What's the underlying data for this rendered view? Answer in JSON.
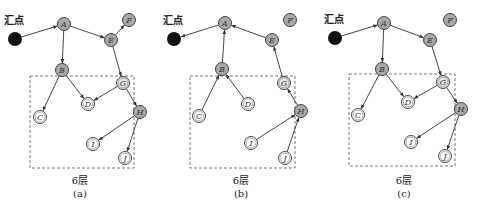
{
  "colors": {
    "sink": "#111111",
    "node_gray": "#a9a9a9",
    "node_light": "#e8e8e8",
    "node_white": "#ffffff",
    "stroke": "#333333"
  },
  "panels": [
    {
      "id": "a",
      "layer_label": "6层",
      "caption": "(a)",
      "sink": {
        "label": "汇点",
        "x": 15,
        "y": 39,
        "label_x": 4,
        "label_y": 24
      },
      "box": {
        "x": 30,
        "y": 76,
        "w": 104,
        "h": 92
      },
      "caption_x": 80,
      "nodes": [
        {
          "id": "A",
          "x": 64,
          "y": 24,
          "fill": "gray"
        },
        {
          "id": "E",
          "x": 111,
          "y": 40,
          "fill": "gray"
        },
        {
          "id": "F",
          "x": 129,
          "y": 20,
          "fill": "gray"
        },
        {
          "id": "B",
          "x": 62,
          "y": 70,
          "fill": "gray"
        },
        {
          "id": "G",
          "x": 123,
          "y": 83,
          "fill": "light"
        },
        {
          "id": "D",
          "x": 88,
          "y": 104,
          "fill": "white"
        },
        {
          "id": "C",
          "x": 40,
          "y": 117,
          "fill": "white"
        },
        {
          "id": "H",
          "x": 140,
          "y": 112,
          "fill": "gray"
        },
        {
          "id": "I",
          "x": 93,
          "y": 144,
          "fill": "white"
        },
        {
          "id": "J",
          "x": 125,
          "y": 158,
          "fill": "white"
        }
      ],
      "edges": [
        [
          "sink",
          "A"
        ],
        [
          "A",
          "E"
        ],
        [
          "E",
          "F"
        ],
        [
          "A",
          "B"
        ],
        [
          "E",
          "G"
        ],
        [
          "B",
          "D"
        ],
        [
          "B",
          "C"
        ],
        [
          "G",
          "D"
        ],
        [
          "G",
          "H"
        ],
        [
          "H",
          "I"
        ],
        [
          "H",
          "J"
        ]
      ]
    },
    {
      "id": "b",
      "layer_label": "6层",
      "caption": "(b)",
      "sink": {
        "label": "汇点",
        "x": 174,
        "y": 39,
        "label_x": 163,
        "label_y": 24
      },
      "box": {
        "x": 190,
        "y": 76,
        "w": 105,
        "h": 92
      },
      "caption_x": 241,
      "nodes": [
        {
          "id": "A",
          "x": 225,
          "y": 23,
          "fill": "gray"
        },
        {
          "id": "E",
          "x": 272,
          "y": 40,
          "fill": "gray"
        },
        {
          "id": "F",
          "x": 290,
          "y": 20,
          "fill": "gray"
        },
        {
          "id": "B",
          "x": 222,
          "y": 69,
          "fill": "gray"
        },
        {
          "id": "G",
          "x": 284,
          "y": 83,
          "fill": "light"
        },
        {
          "id": "D",
          "x": 248,
          "y": 104,
          "fill": "white"
        },
        {
          "id": "C",
          "x": 199,
          "y": 116,
          "fill": "white"
        },
        {
          "id": "H",
          "x": 301,
          "y": 111,
          "fill": "gray"
        },
        {
          "id": "I",
          "x": 251,
          "y": 143,
          "fill": "white"
        },
        {
          "id": "J",
          "x": 285,
          "y": 158,
          "fill": "white"
        }
      ],
      "edges": [
        [
          "A",
          "sink"
        ],
        [
          "E",
          "A"
        ],
        [
          "B",
          "A"
        ],
        [
          "G",
          "E"
        ],
        [
          "C",
          "B"
        ],
        [
          "D",
          "B"
        ],
        [
          "H",
          "G"
        ],
        [
          "I",
          "H"
        ],
        [
          "J",
          "H"
        ]
      ]
    },
    {
      "id": "c",
      "layer_label": "6层",
      "caption": "(c)",
      "sink": {
        "label": "汇点",
        "x": 335,
        "y": 38,
        "label_x": 324,
        "label_y": 23
      },
      "box": {
        "x": 349,
        "y": 74,
        "w": 106,
        "h": 92
      },
      "caption_x": 404,
      "nodes": [
        {
          "id": "A",
          "x": 384,
          "y": 23,
          "fill": "gray"
        },
        {
          "id": "E",
          "x": 430,
          "y": 40,
          "fill": "gray"
        },
        {
          "id": "F",
          "x": 450,
          "y": 20,
          "fill": "gray"
        },
        {
          "id": "B",
          "x": 382,
          "y": 69,
          "fill": "gray"
        },
        {
          "id": "G",
          "x": 443,
          "y": 82,
          "fill": "light"
        },
        {
          "id": "D",
          "x": 408,
          "y": 102,
          "fill": "white"
        },
        {
          "id": "C",
          "x": 358,
          "y": 115,
          "fill": "white"
        },
        {
          "id": "H",
          "x": 461,
          "y": 109,
          "fill": "gray"
        },
        {
          "id": "I",
          "x": 411,
          "y": 142,
          "fill": "white"
        },
        {
          "id": "J",
          "x": 445,
          "y": 156,
          "fill": "white"
        }
      ],
      "edges": [
        [
          "sink",
          "A"
        ],
        [
          "A",
          "E"
        ],
        [
          "A",
          "B"
        ],
        [
          "E",
          "G"
        ],
        [
          "B",
          "C"
        ],
        [
          "B",
          "D"
        ],
        [
          "G",
          "D"
        ],
        [
          "G",
          "H"
        ],
        [
          "H",
          "I"
        ],
        [
          "H",
          "J"
        ]
      ]
    }
  ]
}
